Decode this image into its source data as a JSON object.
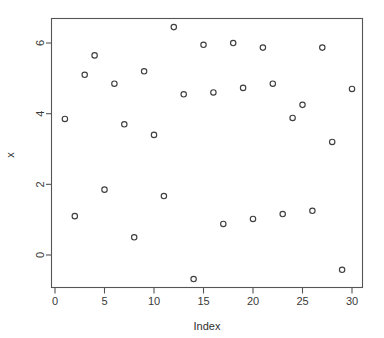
{
  "chart_data": {
    "type": "scatter",
    "title": "",
    "xlabel": "Index",
    "ylabel": "x",
    "xlim": [
      0.0,
      31.0
    ],
    "ylim": [
      -1.1,
      6.7
    ],
    "xticks": [
      0,
      5,
      10,
      15,
      20,
      25,
      30
    ],
    "xtick_labels": [
      "0",
      "5",
      "10",
      "15",
      "20",
      "25",
      "30"
    ],
    "yticks": [
      0,
      2,
      4,
      6
    ],
    "ytick_labels": [
      "0",
      "2",
      "4",
      "6"
    ],
    "grid": false,
    "legend": null,
    "marker": "open-circle",
    "marker_color": "#3f3f3f",
    "n_points": 30,
    "x": [
      1,
      2,
      3,
      4,
      5,
      6,
      7,
      8,
      9,
      10,
      11,
      12,
      13,
      14,
      15,
      16,
      17,
      18,
      19,
      20,
      21,
      22,
      23,
      24,
      25,
      26,
      27,
      28,
      29,
      30
    ],
    "y": [
      3.85,
      1.1,
      5.1,
      5.65,
      1.85,
      4.85,
      3.7,
      0.5,
      5.2,
      3.4,
      1.67,
      6.45,
      4.55,
      -0.68,
      5.95,
      4.6,
      0.88,
      6.0,
      4.73,
      1.02,
      5.87,
      4.85,
      1.16,
      3.88,
      4.25,
      1.25,
      5.87,
      3.2,
      -0.42,
      4.7
    ]
  },
  "axes": {
    "x_title": "Index",
    "y_title": "x"
  }
}
